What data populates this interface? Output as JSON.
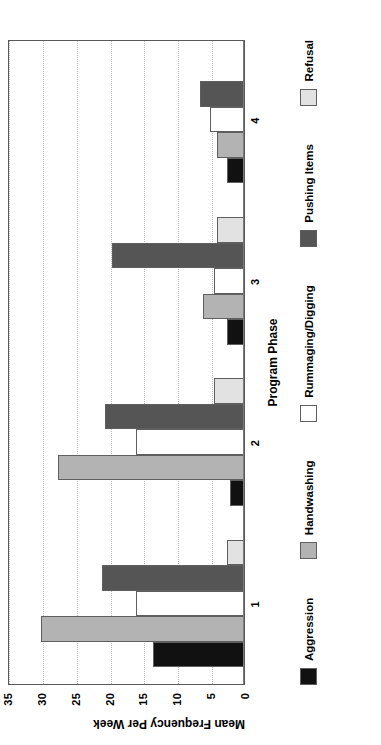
{
  "chart_data": {
    "type": "bar",
    "orientation": "horizontal-rotated",
    "title": "",
    "xlabel": "Program Phase",
    "ylabel": "Mean Frequency Per Week",
    "categories": [
      "1",
      "2",
      "3",
      "4"
    ],
    "ylim": [
      0,
      35
    ],
    "yticks": [
      "0",
      "5",
      "10",
      "15",
      "20",
      "25",
      "30",
      "35"
    ],
    "ytick_values": [
      0,
      5,
      10,
      15,
      20,
      25,
      30,
      35
    ],
    "grid": true,
    "legend_position": "below",
    "series": [
      {
        "name": "Aggression",
        "color": "#111111",
        "values": [
          13.5,
          2.0,
          2.5,
          2.5
        ]
      },
      {
        "name": "Handwashing",
        "color": "#b3b3b3",
        "values": [
          30.0,
          27.5,
          6.0,
          4.0
        ]
      },
      {
        "name": "Rummaging/Digging",
        "color": "#ffffff",
        "values": [
          16.0,
          16.0,
          4.5,
          5.0
        ]
      },
      {
        "name": "Pushing Items",
        "color": "#555555",
        "values": [
          21.0,
          20.5,
          19.5,
          6.5
        ]
      },
      {
        "name": "Refusal",
        "color": "#e2e2e2",
        "values": [
          2.5,
          4.5,
          4.0,
          0.0
        ]
      }
    ]
  }
}
